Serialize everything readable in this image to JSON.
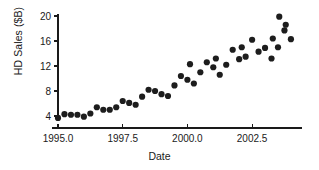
{
  "chart_data": {
    "type": "scatter",
    "title": "",
    "xlabel": "Date",
    "ylabel": "HD Sales ($B)",
    "xlim": [
      1994.7,
      2004.2
    ],
    "ylim": [
      2.0,
      21.0
    ],
    "xticks": [
      1995.0,
      1997.5,
      2000.0,
      2002.5
    ],
    "xticklabels": [
      "1995.0",
      "1997.5",
      "2000.0",
      "2002.5"
    ],
    "yticks": [
      4,
      8,
      12,
      16,
      20
    ],
    "yticklabels": [
      "4",
      "8",
      "12",
      "16",
      "20"
    ],
    "grid": false,
    "legend": false,
    "marker": "filled-circle",
    "marker_color": "#1d1d1d",
    "marker_size": 3.1,
    "x": [
      1995.0,
      1995.25,
      1995.5,
      1995.75,
      1996.0,
      1996.25,
      1996.5,
      1996.75,
      1997.0,
      1997.25,
      1997.5,
      1997.75,
      1998.0,
      1998.25,
      1998.5,
      1998.75,
      1999.0,
      1999.25,
      1999.5,
      1999.75,
      2000.0,
      2000.25,
      2000.5,
      2000.75,
      2001.0,
      2001.25,
      2001.5,
      2001.75,
      2002.0,
      2002.25,
      2002.5,
      2002.75,
      2003.0,
      2003.25,
      2003.5,
      2003.75,
      2004.0
    ],
    "y": [
      3.7,
      4.3,
      4.2,
      4.2,
      3.9,
      4.4,
      5.4,
      5.0,
      5.0,
      5.4,
      6.4,
      6.1,
      5.8,
      7.1,
      8.2,
      8.0,
      7.5,
      7.2,
      8.9,
      10.4,
      9.8,
      9.2,
      11.0,
      12.6,
      11.8,
      10.6,
      12.2,
      14.6,
      13.1,
      13.5,
      16.2,
      14.3,
      14.9,
      13.2,
      15.0,
      17.7,
      16.3
    ],
    "points": [
      {
        "x": 1995.0,
        "y": 3.7
      },
      {
        "x": 1995.25,
        "y": 4.3
      },
      {
        "x": 1995.5,
        "y": 4.2
      },
      {
        "x": 1995.75,
        "y": 4.2
      },
      {
        "x": 1996.0,
        "y": 3.9
      },
      {
        "x": 1996.25,
        "y": 4.4
      },
      {
        "x": 1996.5,
        "y": 5.4
      },
      {
        "x": 1996.75,
        "y": 5.0
      },
      {
        "x": 1997.0,
        "y": 5.0
      },
      {
        "x": 1997.25,
        "y": 5.4
      },
      {
        "x": 1997.5,
        "y": 6.4
      },
      {
        "x": 1997.75,
        "y": 6.1
      },
      {
        "x": 1998.0,
        "y": 5.8
      },
      {
        "x": 1998.25,
        "y": 7.1
      },
      {
        "x": 1998.5,
        "y": 8.2
      },
      {
        "x": 1998.75,
        "y": 8.0
      },
      {
        "x": 1999.0,
        "y": 7.5
      },
      {
        "x": 1999.25,
        "y": 7.2
      },
      {
        "x": 1999.5,
        "y": 8.9
      },
      {
        "x": 1999.75,
        "y": 10.4
      },
      {
        "x": 2000.0,
        "y": 9.8
      },
      {
        "x": 2000.25,
        "y": 9.2
      },
      {
        "x": 2000.5,
        "y": 11.0
      },
      {
        "x": 2000.75,
        "y": 12.6
      },
      {
        "x": 2001.0,
        "y": 11.8
      },
      {
        "x": 2001.25,
        "y": 10.6
      },
      {
        "x": 2001.5,
        "y": 12.2
      },
      {
        "x": 2001.75,
        "y": 14.6
      },
      {
        "x": 2002.0,
        "y": 13.1
      },
      {
        "x": 2002.25,
        "y": 13.5
      },
      {
        "x": 2002.5,
        "y": 16.2
      },
      {
        "x": 2002.75,
        "y": 14.3
      },
      {
        "x": 2003.0,
        "y": 14.9
      },
      {
        "x": 2003.25,
        "y": 13.2
      },
      {
        "x": 2003.5,
        "y": 15.0
      },
      {
        "x": 2003.75,
        "y": 17.7
      },
      {
        "x": 2004.0,
        "y": 16.3
      },
      {
        "x": 2003.3,
        "y": 16.4
      },
      {
        "x": 2003.55,
        "y": 19.9
      },
      {
        "x": 2003.8,
        "y": 18.6
      },
      {
        "x": 2002.1,
        "y": 15.0
      },
      {
        "x": 2001.1,
        "y": 13.2
      },
      {
        "x": 2000.1,
        "y": 12.3
      }
    ],
    "axes_geometry": {
      "x_origin_px": 58,
      "x_px_per_unit": 25.88,
      "y_origin_px": 116,
      "y_px_per_unit": 6.25,
      "x_axis_y_px": 128,
      "x_axis_x1_px": 52,
      "x_axis_x2_px": 302,
      "y_axis_x_px": 58,
      "y_axis_y1_px": 14,
      "y_axis_y2_px": 121
    }
  }
}
